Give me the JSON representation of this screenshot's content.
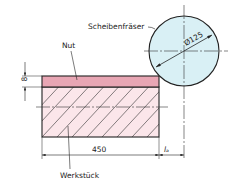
{
  "labels": {
    "cutter": "Scheibenfräser",
    "groove": "Nut",
    "workpiece": "Werkstück",
    "diameter": "Ø125",
    "depth": "8",
    "length": "450",
    "approach": "lₐ"
  },
  "colors": {
    "cutter_fill": "#d9f0f5",
    "groove_fill": "#e8a6b4",
    "workpiece_fill": "#fbe6ea",
    "line": "#222222"
  }
}
